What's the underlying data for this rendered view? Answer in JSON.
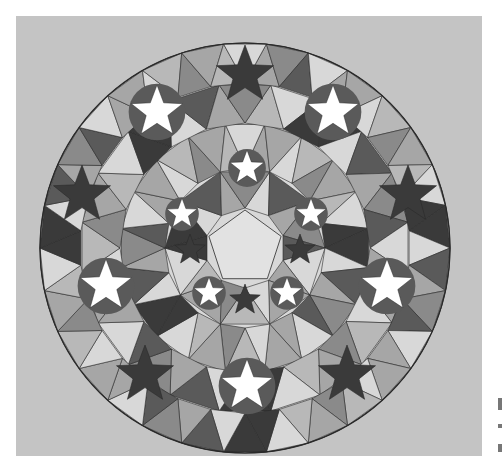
{
  "artwork": {
    "subject": "geometric five-pointed star mandala",
    "palette": {
      "paper": "#c4c4c4",
      "light": "#d8d8d8",
      "mid": "#a6a6a6",
      "dark": "#5a5a5a",
      "darkest": "#3a3a3a",
      "star_white": "#ffffff",
      "line": "#2a2a2a"
    },
    "circle": {
      "cx": 245,
      "cy": 248,
      "r": 205
    },
    "white_stars": [
      {
        "x": 157,
        "y": 112,
        "r": 27
      },
      {
        "x": 333,
        "y": 112,
        "r": 27
      },
      {
        "x": 247,
        "y": 168,
        "r": 18
      },
      {
        "x": 182,
        "y": 214,
        "r": 16
      },
      {
        "x": 311,
        "y": 214,
        "r": 16
      },
      {
        "x": 106,
        "y": 286,
        "r": 27
      },
      {
        "x": 387,
        "y": 286,
        "r": 27
      },
      {
        "x": 209,
        "y": 293,
        "r": 16
      },
      {
        "x": 287,
        "y": 293,
        "r": 16
      },
      {
        "x": 247,
        "y": 386,
        "r": 27
      }
    ],
    "dark_stars": [
      {
        "x": 245,
        "y": 75,
        "r": 30
      },
      {
        "x": 82,
        "y": 195,
        "r": 30
      },
      {
        "x": 408,
        "y": 195,
        "r": 30
      },
      {
        "x": 145,
        "y": 375,
        "r": 30
      },
      {
        "x": 347,
        "y": 375,
        "r": 30
      },
      {
        "x": 245,
        "y": 300,
        "r": 16
      },
      {
        "x": 300,
        "y": 250,
        "r": 16
      },
      {
        "x": 190,
        "y": 250,
        "r": 16
      }
    ]
  }
}
